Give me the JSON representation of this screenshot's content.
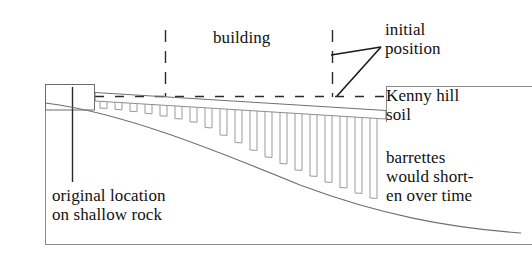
{
  "diagram": {
    "labels": {
      "building": "building",
      "initial_position": "initial\nposition",
      "kenny_hill_soil": "Kenny hill\nsoil",
      "barrettes_note": "barrettes\nwould short-\nen over time",
      "original_location": "original location\non shallow rock"
    },
    "colors": {
      "ink": "#111111",
      "line": "#555555",
      "line_light": "#777777",
      "background": "#ffffff"
    },
    "elements": {
      "frame": {
        "name": "drawing-frame",
        "left_x": 45,
        "top_y": 84,
        "bottom_y": 245,
        "right_x": 532
      },
      "rock_block": {
        "name": "shallow-rock-block",
        "x": 45,
        "y": 84,
        "width": 50,
        "height": 26
      },
      "initial_position_line": {
        "name": "initial-position-dashed-line",
        "y": 96,
        "from_x": 95,
        "to_x": 386,
        "style": "dashed"
      },
      "building_edge_left": {
        "name": "building-left-dashed-edge",
        "x": 165,
        "from_y": 30,
        "to_y": 97,
        "style": "dashed"
      },
      "building_edge_right": {
        "name": "building-right-dashed-edge",
        "x": 332,
        "from_y": 30,
        "to_y": 97,
        "style": "dashed"
      },
      "leader_original": {
        "name": "original-location-leader",
        "x": 72,
        "from_y": 88,
        "to_y": 182
      },
      "ground_line": {
        "name": "kenny-hill-ground-line",
        "from_x": 386,
        "to_x": 532,
        "y": 86
      },
      "settled_raft_top": {
        "name": "settled-raft-top-line",
        "from": [
          95,
          93
        ],
        "to": [
          386,
          111
        ]
      },
      "rock_profile": {
        "name": "rock-profile-curve",
        "from": [
          45,
          104
        ],
        "to": [
          520,
          232
        ]
      }
    },
    "barrette_count": 18,
    "barrette_note": "Barrette lengths increase from left to right as the rock head deepens."
  }
}
